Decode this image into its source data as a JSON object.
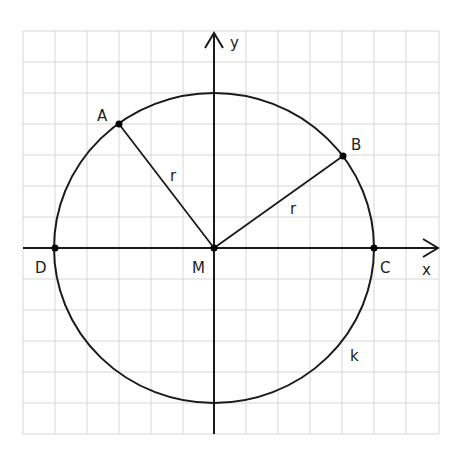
{
  "figure": {
    "type": "circle-on-coordinate-grid",
    "grid": {
      "cols": 13,
      "rows": 13,
      "line_color": "#d6d6d6"
    },
    "axes": {
      "x_label": "x",
      "y_label": "y"
    },
    "circle": {
      "label": "k",
      "center": "M",
      "radius_units": 5
    },
    "points": [
      {
        "name": "A",
        "grid": [
          -3,
          4
        ]
      },
      {
        "name": "B",
        "grid": [
          4,
          3
        ]
      },
      {
        "name": "C",
        "grid": [
          5,
          0
        ]
      },
      {
        "name": "D",
        "grid": [
          -5,
          0
        ]
      },
      {
        "name": "M",
        "grid": [
          0,
          0
        ]
      }
    ],
    "segments": [
      {
        "from": "M",
        "to": "A",
        "label": "r"
      },
      {
        "from": "M",
        "to": "B",
        "label": "r"
      }
    ]
  },
  "labels": {
    "A": "A",
    "B": "B",
    "C": "C",
    "D": "D",
    "M": "M",
    "x": "x",
    "y": "y",
    "k": "k",
    "r1": "r",
    "r2": "r"
  }
}
